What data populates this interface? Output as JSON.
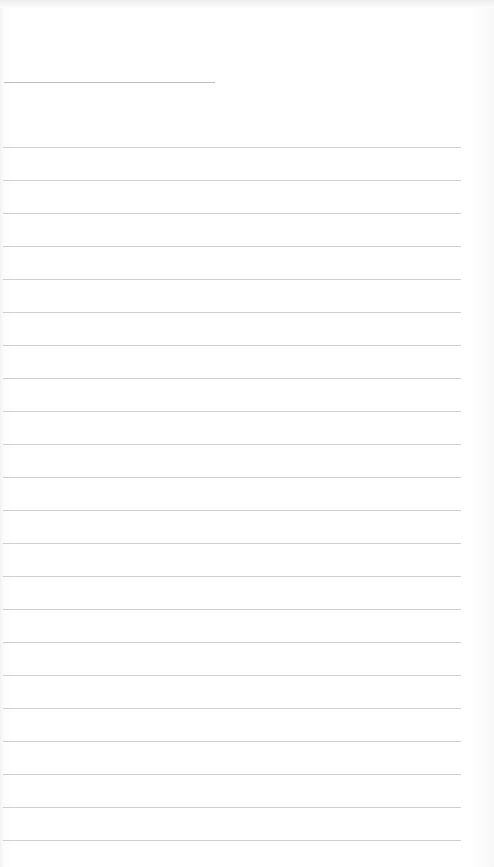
{
  "page": {
    "type": "blank-lined-paper",
    "background_color": "#ffffff",
    "line_color": "#cfcfcf",
    "title_line": {
      "top": 82,
      "left": 4,
      "width": 211
    },
    "rules": {
      "count": 22,
      "first_top": 147,
      "spacing": 33,
      "left": 3,
      "width": 458
    }
  }
}
